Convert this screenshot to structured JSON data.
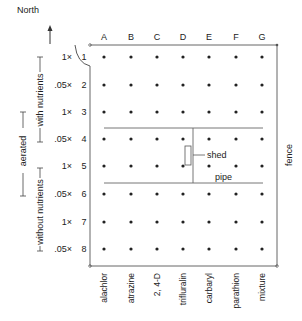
{
  "compass": {
    "label": "North",
    "icon": "north-arrow-icon"
  },
  "columns": [
    {
      "letter": "A",
      "chemical": "alachlor",
      "x": 104
    },
    {
      "letter": "B",
      "chemical": "atrazine",
      "x": 131
    },
    {
      "letter": "C",
      "chemical": "2, 4-D",
      "x": 157
    },
    {
      "letter": "D",
      "chemical": "trifluralin",
      "x": 183
    },
    {
      "letter": "E",
      "chemical": "carbaryl",
      "x": 209
    },
    {
      "letter": "F",
      "chemical": "parathion",
      "x": 236
    },
    {
      "letter": "G",
      "chemical": "mixture",
      "x": 262
    }
  ],
  "rows": [
    {
      "number": "1",
      "concentration": "1×",
      "y": 57
    },
    {
      "number": "2",
      "concentration": ".05×",
      "y": 85
    },
    {
      "number": "3",
      "concentration": "1×",
      "y": 112
    },
    {
      "number": "4",
      "concentration": ".05×",
      "y": 139
    },
    {
      "number": "5",
      "concentration": "1×",
      "y": 166
    },
    {
      "number": "6",
      "concentration": ".05×",
      "y": 194
    },
    {
      "number": "7",
      "concentration": "1×",
      "y": 222
    },
    {
      "number": "8",
      "concentration": ".05×",
      "y": 249
    }
  ],
  "groups": {
    "with_nutrients": "with nutrients",
    "without_nutrients": "without nutrients",
    "aerated": "aerated"
  },
  "features": {
    "shed": "shed",
    "pipe": "pipe",
    "fence": "fence"
  },
  "colors": {
    "ink": "#222222",
    "line": "#555555",
    "background": "#ffffff"
  }
}
